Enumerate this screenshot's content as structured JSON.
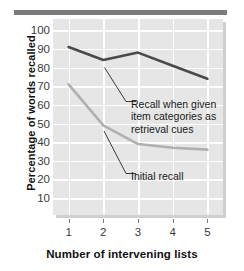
{
  "figure": {
    "y_axis_title": "Percentage of words recalled",
    "x_axis_title": "Number of intervening lists"
  },
  "annotations": {
    "cued": "Recall when given item categories as retrieval cues",
    "initial": "Initial recall"
  },
  "ticks": {
    "y": [
      "100",
      "90",
      "80",
      "70",
      "60",
      "50",
      "40",
      "30",
      "20",
      "10"
    ],
    "x": [
      "1",
      "2",
      "3",
      "4",
      "5"
    ]
  },
  "chart_data": {
    "type": "line",
    "title": "",
    "xlabel": "Number of intervening lists",
    "ylabel": "Percentage of words recalled",
    "x": [
      1,
      2,
      3,
      4,
      5
    ],
    "xlim": [
      0.55,
      5.45
    ],
    "ylim": [
      0,
      105
    ],
    "yticks": [
      10,
      20,
      30,
      40,
      50,
      60,
      70,
      80,
      90,
      100
    ],
    "grid": true,
    "legend": "annotations-inline",
    "series": [
      {
        "name": "Recall when given item categories as retrieval cues",
        "color": "#4a4a4a",
        "values": [
          90,
          83,
          87,
          80,
          73
        ]
      },
      {
        "name": "Initial recall",
        "color": "#b0b0b0",
        "values": [
          70,
          48,
          38,
          36,
          35
        ]
      }
    ],
    "annotations": [
      {
        "text": "Recall when given item categories as retrieval cues",
        "points_to_series": "Recall when given item categories as retrieval cues"
      },
      {
        "text": "Initial recall",
        "points_to_series": "Initial recall"
      }
    ]
  }
}
